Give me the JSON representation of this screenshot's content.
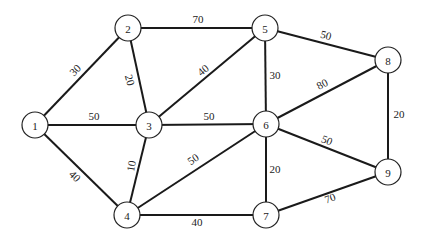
{
  "diagram": {
    "type": "weighted-undirected-graph",
    "node_radius": 13,
    "nodes": [
      {
        "id": "1",
        "label": "1",
        "x": 35,
        "y": 125
      },
      {
        "id": "2",
        "label": "2",
        "x": 128,
        "y": 28
      },
      {
        "id": "3",
        "label": "3",
        "x": 149,
        "y": 125
      },
      {
        "id": "4",
        "label": "4",
        "x": 127,
        "y": 215
      },
      {
        "id": "5",
        "label": "5",
        "x": 265,
        "y": 28
      },
      {
        "id": "6",
        "label": "6",
        "x": 266,
        "y": 124
      },
      {
        "id": "7",
        "label": "7",
        "x": 266,
        "y": 215
      },
      {
        "id": "8",
        "label": "8",
        "x": 388,
        "y": 60
      },
      {
        "id": "9",
        "label": "9",
        "x": 388,
        "y": 172
      }
    ],
    "edges": [
      {
        "from": "1",
        "to": "2",
        "weight": "30",
        "lx": 75,
        "ly": 70,
        "rot": -45
      },
      {
        "from": "1",
        "to": "3",
        "weight": "50",
        "lx": 94,
        "ly": 116,
        "rot": 0
      },
      {
        "from": "1",
        "to": "4",
        "weight": "40",
        "lx": 75,
        "ly": 176,
        "rot": 45
      },
      {
        "from": "2",
        "to": "3",
        "weight": "20",
        "lx": 130,
        "ly": 80,
        "rot": 75
      },
      {
        "from": "2",
        "to": "5",
        "weight": "70",
        "lx": 198,
        "ly": 19,
        "rot": 0
      },
      {
        "from": "3",
        "to": "5",
        "weight": "40",
        "lx": 203,
        "ly": 70,
        "rot": -40
      },
      {
        "from": "3",
        "to": "6",
        "weight": "50",
        "lx": 209,
        "ly": 116,
        "rot": 0
      },
      {
        "from": "3",
        "to": "4",
        "weight": "10",
        "lx": 131,
        "ly": 166,
        "rot": -80
      },
      {
        "from": "4",
        "to": "6",
        "weight": "50",
        "lx": 193,
        "ly": 159,
        "rot": -35
      },
      {
        "from": "4",
        "to": "7",
        "weight": "40",
        "lx": 197,
        "ly": 222,
        "rot": 0
      },
      {
        "from": "5",
        "to": "6",
        "weight": "30",
        "lx": 275,
        "ly": 75,
        "rot": 0
      },
      {
        "from": "5",
        "to": "8",
        "weight": "50",
        "lx": 326,
        "ly": 35,
        "rot": 14
      },
      {
        "from": "6",
        "to": "8",
        "weight": "80",
        "lx": 322,
        "ly": 84,
        "rot": -28
      },
      {
        "from": "6",
        "to": "9",
        "weight": "50",
        "lx": 327,
        "ly": 140,
        "rot": 22
      },
      {
        "from": "6",
        "to": "7",
        "weight": "20",
        "lx": 275,
        "ly": 169,
        "rot": 0
      },
      {
        "from": "7",
        "to": "9",
        "weight": "70",
        "lx": 330,
        "ly": 198,
        "rot": -20
      },
      {
        "from": "8",
        "to": "9",
        "weight": "20",
        "lx": 399,
        "ly": 114,
        "rot": 0
      }
    ]
  }
}
